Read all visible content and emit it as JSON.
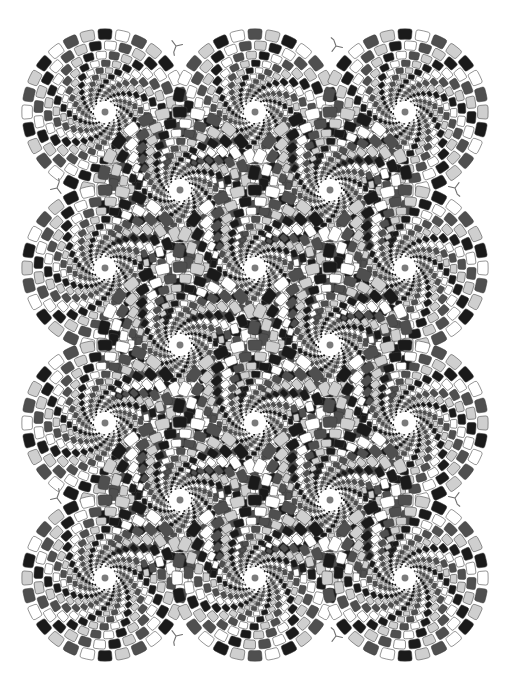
{
  "figure": {
    "kind": "optical-illusion-image",
    "name": "Rotating Snakes",
    "illusion_type": "peripheral drift",
    "background_color": "#ffffff",
    "width": 510,
    "height": 686,
    "caption": "Rotating Snakes peripheral drift optical illusion: a staggered grid of circular snake discs built from concentric rings of rounded tiles."
  },
  "palette": {
    "black": "#1a1a1a",
    "dark_gray": "#4f4f4f",
    "white": "#ffffff",
    "light_gray": "#cfcfcf",
    "outline": "#3d3d3d",
    "mark_stroke": "#6e6e6e"
  },
  "tile_sequence": [
    "light_gray",
    "black",
    "white",
    "dark_gray"
  ],
  "disc_geometry": {
    "outer_radius": 84,
    "min_radius": 3.0,
    "ring_count": 13,
    "ring_scale": 0.855,
    "tiles_per_ring": 28,
    "ring_twist_deg": 4.6,
    "tile_arc_fill": 0.78,
    "tile_radial_fill": 0.86,
    "tile_corner_round": 0.42,
    "outline_width": 0.55
  },
  "grid": {
    "description": "Staggered rows of disc centers; odd rows are offset by half the column pitch.",
    "column_pitch": 150,
    "row_pitch": 78,
    "discs": [
      {
        "id": "disc-r1-c1",
        "cx": 105,
        "cy": 112,
        "spin": 0,
        "phase": 0
      },
      {
        "id": "disc-r1-c2",
        "cx": 255,
        "cy": 112,
        "spin": 0,
        "phase": 2
      },
      {
        "id": "disc-r1-c3",
        "cx": 405,
        "cy": 112,
        "spin": 0,
        "phase": 0
      },
      {
        "id": "disc-r2-c1",
        "cx": 180,
        "cy": 190,
        "spin": 180,
        "phase": 2
      },
      {
        "id": "disc-r2-c2",
        "cx": 330,
        "cy": 190,
        "spin": 180,
        "phase": 0
      },
      {
        "id": "disc-r3-c1",
        "cx": 105,
        "cy": 268,
        "spin": 0,
        "phase": 2
      },
      {
        "id": "disc-r3-c2",
        "cx": 255,
        "cy": 268,
        "spin": 0,
        "phase": 0
      },
      {
        "id": "disc-r3-c3",
        "cx": 405,
        "cy": 268,
        "spin": 0,
        "phase": 2
      },
      {
        "id": "disc-r4-c1",
        "cx": 180,
        "cy": 345,
        "spin": 180,
        "phase": 0
      },
      {
        "id": "disc-r4-c2",
        "cx": 330,
        "cy": 345,
        "spin": 180,
        "phase": 2
      },
      {
        "id": "disc-r5-c1",
        "cx": 105,
        "cy": 423,
        "spin": 0,
        "phase": 0
      },
      {
        "id": "disc-r5-c2",
        "cx": 255,
        "cy": 423,
        "spin": 0,
        "phase": 2
      },
      {
        "id": "disc-r5-c3",
        "cx": 405,
        "cy": 423,
        "spin": 0,
        "phase": 0
      },
      {
        "id": "disc-r6-c1",
        "cx": 180,
        "cy": 500,
        "spin": 180,
        "phase": 2
      },
      {
        "id": "disc-r6-c2",
        "cx": 330,
        "cy": 500,
        "spin": 180,
        "phase": 0
      },
      {
        "id": "disc-r7-c1",
        "cx": 105,
        "cy": 578,
        "spin": 0,
        "phase": 2
      },
      {
        "id": "disc-r7-c2",
        "cx": 255,
        "cy": 578,
        "spin": 0,
        "phase": 0
      },
      {
        "id": "disc-r7-c3",
        "cx": 405,
        "cy": 578,
        "spin": 0,
        "phase": 2
      }
    ]
  },
  "claw_marks": {
    "description": "Small three-pronged Y-shaped marks tucked into gaps between discs.",
    "size": 13,
    "stroke_width": 1.1,
    "items": [
      {
        "id": "mark-top-left",
        "x": 176,
        "y": 46,
        "rot": 20
      },
      {
        "id": "mark-top-right",
        "x": 336,
        "y": 46,
        "rot": 160
      },
      {
        "id": "mark-upper-left-edge",
        "x": 57,
        "y": 188,
        "rot": 200
      },
      {
        "id": "mark-upper-right-edge",
        "x": 455,
        "y": 188,
        "rot": 340
      },
      {
        "id": "mark-lower-left-edge",
        "x": 57,
        "y": 498,
        "rot": 200
      },
      {
        "id": "mark-lower-right-edge",
        "x": 455,
        "y": 498,
        "rot": 340
      },
      {
        "id": "mark-bottom-left",
        "x": 176,
        "y": 636,
        "rot": 20
      },
      {
        "id": "mark-bottom-right",
        "x": 336,
        "y": 636,
        "rot": 160
      }
    ]
  }
}
